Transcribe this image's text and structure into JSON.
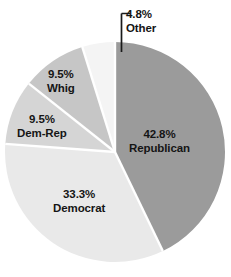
{
  "chart_data": {
    "type": "pie",
    "title": "",
    "subtitle": "",
    "xlabel": "",
    "ylabel": "",
    "legend_position": "none",
    "grid": false,
    "labels_inside": true,
    "categories": [
      "Republican",
      "Democrat",
      "Dem-Rep",
      "Whig",
      "Other"
    ],
    "values": [
      42.8,
      33.3,
      9.5,
      9.5,
      4.8
    ],
    "value_unit": "%",
    "slices": [
      {
        "name": "Republican",
        "value": 42.8,
        "percent_label": "42.8%",
        "name_label": "Republican",
        "color": "#9b9b9b",
        "start_angle": 0,
        "end_angle": 154.1,
        "label_placement": "inside"
      },
      {
        "name": "Democrat",
        "value": 33.3,
        "percent_label": "33.3%",
        "name_label": "Democrat",
        "color": "#e9e9e9",
        "start_angle": 154.1,
        "end_angle": 274.0,
        "label_placement": "inside"
      },
      {
        "name": "Dem-Rep",
        "value": 9.5,
        "percent_label": "9.5%",
        "name_label": "Dem-Rep",
        "color": "#d5d5d5",
        "start_angle": 274.0,
        "end_angle": 308.2,
        "label_placement": "inside"
      },
      {
        "name": "Whig",
        "value": 9.5,
        "percent_label": "9.5%",
        "name_label": "Whig",
        "color": "#c6c6c6",
        "start_angle": 308.2,
        "end_angle": 342.4,
        "label_placement": "inside"
      },
      {
        "name": "Other",
        "value": 4.8,
        "percent_label": "4.8%",
        "name_label": "Other",
        "color": "#f4f4f4",
        "start_angle": 342.4,
        "end_angle": 360.0,
        "label_placement": "callout"
      }
    ],
    "separator_color": "#ffffff",
    "callout_line_color": "#1a1a1a",
    "label_text_color": "#151515",
    "background": "#ffffff"
  }
}
